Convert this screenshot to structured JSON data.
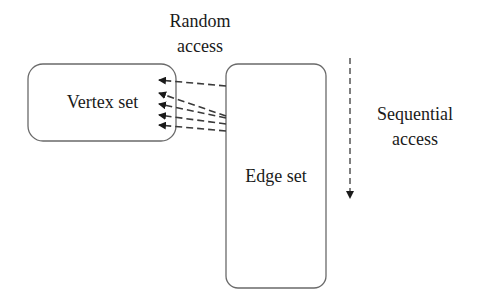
{
  "diagram": {
    "random_access": {
      "line1": "Random",
      "line2": "access"
    },
    "vertex_set": {
      "label": "Vertex set"
    },
    "edge_set": {
      "label": "Edge set"
    },
    "sequential_access": {
      "line1": "Sequential",
      "line2": "access"
    },
    "colors": {
      "stroke": "#555555",
      "arrow": "#1a1a1a",
      "text": "#1a1a1a"
    }
  }
}
